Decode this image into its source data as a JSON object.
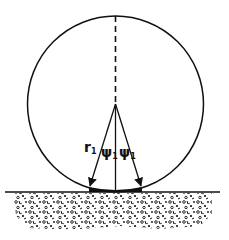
{
  "diagram": {
    "title": "",
    "labels": {
      "radius": "r",
      "radius_sub": "1",
      "angle_left": "ψ",
      "angle_left_sub": "1",
      "angle_right": "ψ",
      "angle_right_sub": "1"
    },
    "elements": [
      "wheel-circle",
      "vertical-dashed-axis",
      "radius-arrow-left",
      "radius-arrow-right",
      "vertical-solid-line",
      "contact-patch",
      "ground-line",
      "soil-texture"
    ],
    "colors": {
      "stroke": "#111111",
      "background": "#ffffff"
    }
  }
}
